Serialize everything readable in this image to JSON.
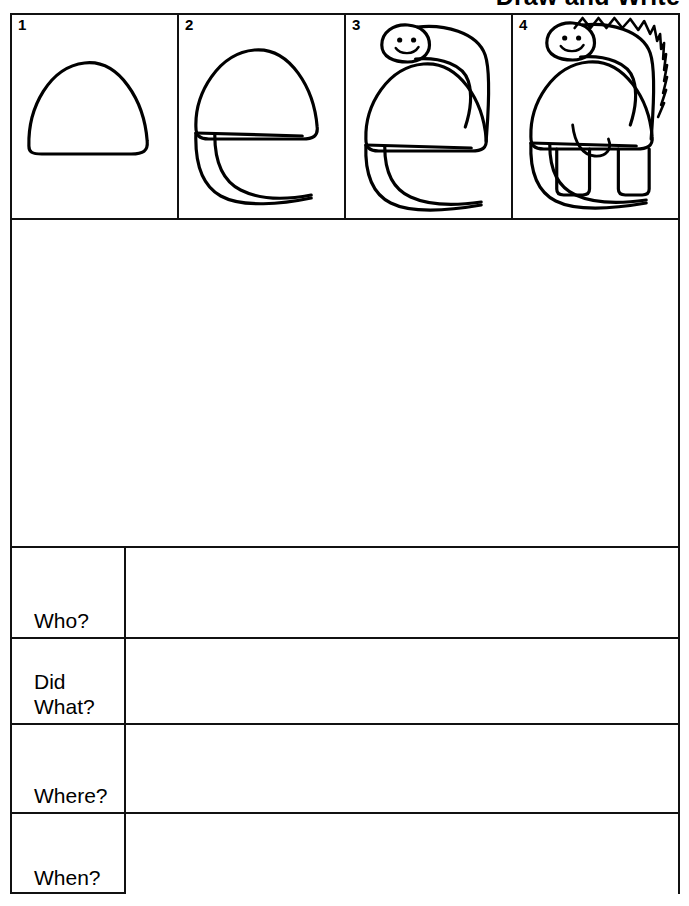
{
  "page": {
    "title": "Draw and Write",
    "background_color": "#ffffff",
    "ink_color": "#111111"
  },
  "steps": {
    "panels": [
      {
        "number": "1",
        "caption": "dinosaur body outline - dome shape",
        "parts": [
          "body"
        ]
      },
      {
        "number": "2",
        "caption": "body with tail added",
        "parts": [
          "body",
          "belly-line",
          "tail"
        ]
      },
      {
        "number": "3",
        "caption": "body, tail, neck and smiling head added",
        "parts": [
          "body",
          "belly-line",
          "tail",
          "neck",
          "head",
          "eyes",
          "smile"
        ]
      },
      {
        "number": "4",
        "caption": "complete dinosaur with back spikes and legs",
        "parts": [
          "body",
          "belly-line",
          "tail",
          "neck",
          "head",
          "eyes",
          "smile",
          "spikes",
          "front-leg",
          "back-leg",
          "haunch-curve"
        ]
      }
    ]
  },
  "draw_area": {
    "label": "blank drawing space",
    "content": ""
  },
  "questions": {
    "rows": [
      {
        "label": "Who?",
        "answer": ""
      },
      {
        "label": "Did\nWhat?",
        "answer": ""
      },
      {
        "label": "Where?",
        "answer": ""
      },
      {
        "label": "When?",
        "answer": ""
      }
    ]
  }
}
